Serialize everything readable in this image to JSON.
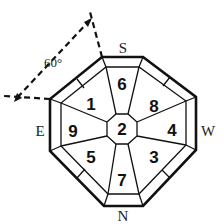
{
  "diagram": {
    "type": "octagonal-compass-layout",
    "directions": {
      "south": "S",
      "west": "W",
      "north": "N",
      "east": "E"
    },
    "angle_label": "60°",
    "sectors": {
      "top": "6",
      "top_right": "8",
      "right": "4",
      "bottom_right": "3",
      "bottom": "7",
      "bottom_left": "5",
      "left": "9",
      "top_left": "1",
      "center": "2"
    },
    "colors": {
      "line": "#111111",
      "background": "#ffffff"
    }
  }
}
